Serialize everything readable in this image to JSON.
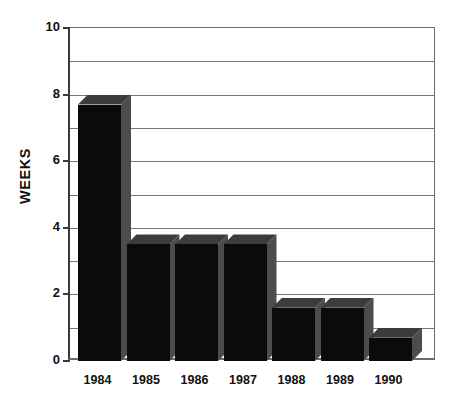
{
  "chart_data": {
    "type": "bar",
    "title": "",
    "xlabel": "",
    "ylabel": "WEEKS",
    "categories": [
      "1984",
      "1985",
      "1986",
      "1987",
      "1988",
      "1989",
      "1990"
    ],
    "values": [
      8.0,
      3.8,
      3.8,
      3.8,
      1.9,
      1.9,
      1.0
    ],
    "series": [
      {
        "name": "Weeks",
        "values": [
          8.0,
          3.8,
          3.8,
          3.8,
          1.9,
          1.9,
          1.0
        ]
      }
    ],
    "ylim": [
      0,
      10
    ],
    "ytick_labels": [
      "0",
      "2",
      "4",
      "6",
      "8",
      "10"
    ],
    "ytick_values": [
      0,
      2,
      4,
      6,
      8,
      10
    ],
    "gridlines": [
      1,
      2,
      3,
      4,
      5,
      6,
      7,
      8,
      9,
      10
    ],
    "grid": true,
    "legend": "none",
    "style": "3d-bar",
    "colors": {
      "bar_front": "#0b0b0b",
      "bar_side": "#4c4c4c",
      "bar_top": "#3c3c3c",
      "grid": "#777777",
      "axis": "#3a3a3a",
      "text": "#111111",
      "background": "#ffffff"
    }
  },
  "axes": {
    "y": {
      "title": "WEEKS",
      "ticks": [
        {
          "label": "10",
          "value": 10
        },
        {
          "label": "8",
          "value": 8
        },
        {
          "label": "6",
          "value": 6
        },
        {
          "label": "4",
          "value": 4
        },
        {
          "label": "2",
          "value": 2
        },
        {
          "label": "0",
          "value": 0
        }
      ]
    },
    "x": {
      "ticks": [
        {
          "label": "1984"
        },
        {
          "label": "1985"
        },
        {
          "label": "1986"
        },
        {
          "label": "1987"
        },
        {
          "label": "1988"
        },
        {
          "label": "1989"
        },
        {
          "label": "1990"
        }
      ]
    }
  }
}
